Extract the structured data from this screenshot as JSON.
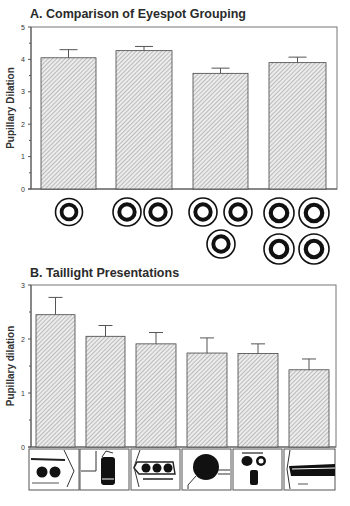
{
  "chart_data": [
    {
      "type": "bar",
      "panel": "A",
      "title": "A. Comparison of Eyespot Grouping",
      "xlabel": "",
      "ylabel": "Pupillary Dilation",
      "ylim": [
        0,
        5
      ],
      "yticks": [
        0,
        1,
        2,
        3,
        4,
        5
      ],
      "minor_ticks": true,
      "grid": false,
      "categories": [
        "1 eyespot",
        "2 eyespots",
        "3 eyespots",
        "4 eyespots"
      ],
      "values": [
        4.05,
        4.27,
        3.57,
        3.9
      ],
      "error_upper": [
        4.3,
        4.4,
        3.73,
        4.07
      ],
      "bar_fill": "diagonal hatch",
      "x_icons": [
        {
          "count": 1,
          "icon": "concentric-ring-eyespot-icon"
        },
        {
          "count": 2,
          "icon": "concentric-ring-eyespot-icon"
        },
        {
          "count": 3,
          "icon": "concentric-ring-eyespot-icon"
        },
        {
          "count": 4,
          "icon": "concentric-ring-eyespot-icon"
        }
      ]
    },
    {
      "type": "bar",
      "panel": "B",
      "title": "B. Taillight Presentations",
      "xlabel": "",
      "ylabel": "Pupillary dilation",
      "ylim": [
        0,
        3
      ],
      "yticks": [
        0,
        1,
        2,
        3
      ],
      "minor_ticks": true,
      "grid": false,
      "categories": [
        "Taillight 1 (two round lights)",
        "Taillight 2 (vertical lamp)",
        "Taillight 3 (three round lights)",
        "Taillight 4 (single large round)",
        "Taillight 5 (face-like)",
        "Taillight 6 (horizontal strip)"
      ],
      "values": [
        2.45,
        2.05,
        1.91,
        1.74,
        1.73,
        1.43
      ],
      "error_upper": [
        2.77,
        2.25,
        2.12,
        2.02,
        1.91,
        1.63
      ],
      "bar_fill": "diagonal hatch",
      "x_icons": [
        {
          "icon": "taillight-two-round-icon"
        },
        {
          "icon": "taillight-vertical-lamp-icon"
        },
        {
          "icon": "taillight-three-round-icon"
        },
        {
          "icon": "taillight-large-round-icon"
        },
        {
          "icon": "taillight-face-icon"
        },
        {
          "icon": "taillight-horizontal-strip-icon"
        }
      ]
    }
  ],
  "colors": {
    "bar_fill": "#e6e6e6",
    "hatch": "#8a8a8a",
    "stroke": "#444444",
    "text": "#2a2a2a"
  }
}
